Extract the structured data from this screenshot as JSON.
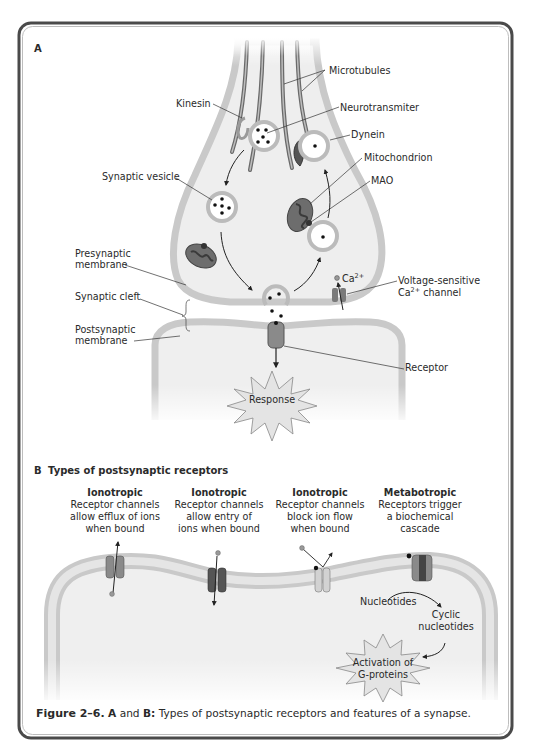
{
  "panel_a": {
    "letter": "A",
    "labels": {
      "microtubules": "Microtubules",
      "kinesin": "Kinesin",
      "neurotransmitter": "Neurotransmiter",
      "dynein": "Dynein",
      "mitochondrion": "Mitochondrion",
      "mao": "MAO",
      "synaptic_vesicle": "Synaptic vesicle",
      "presynaptic_membrane_1": "Presynaptic",
      "presynaptic_membrane_2": "membrane",
      "synaptic_cleft": "Synaptic cleft",
      "postsynaptic_membrane_1": "Postsynaptic",
      "postsynaptic_membrane_2": "membrane",
      "ca_ion": "Ca",
      "ca_ion_sup": "2+",
      "voltage_channel_1": "Voltage-sensitive",
      "voltage_channel_2_prefix": "Ca",
      "voltage_channel_2_sup": "2+",
      "voltage_channel_2_suffix": " channel",
      "receptor": "Receptor",
      "response": "Response"
    }
  },
  "panel_b": {
    "letter": "B",
    "title": "Types of postsynaptic receptors",
    "receptors": [
      {
        "type": "Ionotropic",
        "lines": [
          "Receptor channels",
          "allow efflux of ions",
          "when bound"
        ]
      },
      {
        "type": "Ionotropic",
        "lines": [
          "Receptor channels",
          "allow entry of",
          "ions when bound"
        ]
      },
      {
        "type": "Ionotropic",
        "lines": [
          "Receptor channels",
          "block ion flow",
          "when bound"
        ]
      },
      {
        "type": "Metabotropic",
        "lines": [
          "Receptors trigger",
          "a biochemical",
          "cascade"
        ]
      }
    ],
    "cascade": {
      "nucleotides": "Nucleotides",
      "cyclic_1": "Cyclic",
      "cyclic_2": "nucleotides",
      "activation_1": "Activation of",
      "activation_2": "G-proteins"
    }
  },
  "caption": {
    "figure_label": "Figure 2–6.",
    "a": "A",
    "and": " and ",
    "b": "B:",
    "text": " Types of postsynaptic receptors and features of a synapse."
  },
  "colors": {
    "membrane": "#c8c8c8",
    "cytoplasm": "#efefef",
    "frame": "#555555",
    "mitochondrion": "#6d6d6d",
    "receptor": "#8a8a8a",
    "starburst": "#e4e4e4"
  }
}
